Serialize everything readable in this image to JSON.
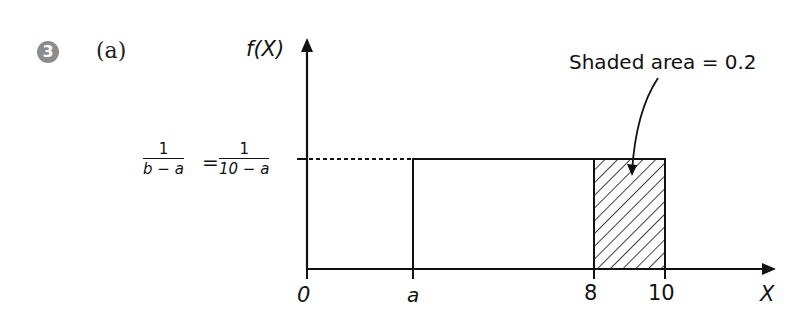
{
  "question": {
    "number": "3",
    "part": "(a)"
  },
  "axes": {
    "y_label": "f(X)",
    "x_label": "X"
  },
  "height_label": {
    "lhs_num": "1",
    "lhs_den": "b − a",
    "equals": "=",
    "rhs_num": "1",
    "rhs_den": "10 − a"
  },
  "x_ticks": [
    {
      "label": "0",
      "value": 0
    },
    {
      "label": "a",
      "value": "a"
    },
    {
      "label": "8",
      "value": 8
    },
    {
      "label": "10",
      "value": 10
    }
  ],
  "annotation": {
    "text": "Shaded area = 0.2"
  },
  "distribution": {
    "type": "uniform",
    "lower": "a",
    "upper": 10,
    "shaded_from": 8,
    "shaded_to": 10,
    "shaded_area": 0.2
  },
  "colors": {
    "line": "#111111",
    "badge": "#8c8c8c"
  }
}
